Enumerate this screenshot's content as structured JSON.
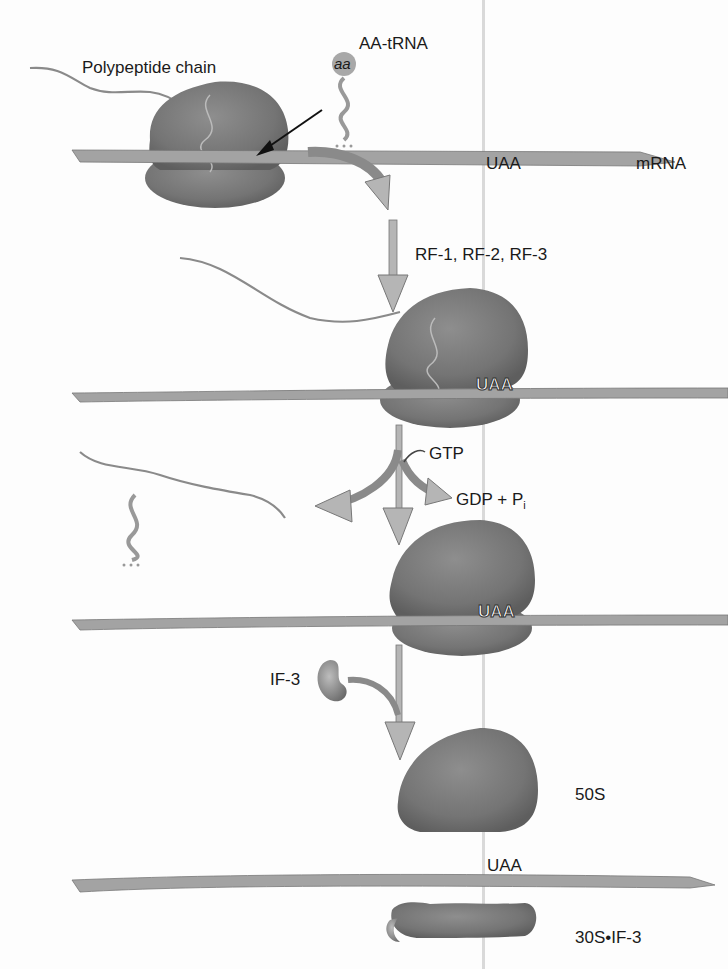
{
  "figure": {
    "labels": {
      "polypeptide": "Polypeptide chain",
      "aa_trna": "AA-tRNA",
      "aa": "aa",
      "mrna": "mRNA",
      "uaa": "UAA",
      "release_factors": "RF-1, RF-2, RF-3",
      "gtp": "GTP",
      "gdp": "GDP + P",
      "gdp_sub": "i",
      "if3": "IF-3",
      "s50": "50S",
      "s30_if3": "30S•IF-3"
    },
    "colors": {
      "ribosome": "#6e6e6e",
      "ribosome_light": "#8c8c8c",
      "mrna": "#9a9a9a",
      "arrow_fill": "#b5b5b5",
      "chain": "#8a8a8a",
      "text": "#1a1a1a"
    },
    "steps": [
      {
        "step": 1,
        "description": "Ribosome with polypeptide chain on mRNA; AA-tRNA approaches; UAA stop codon"
      },
      {
        "step": 2,
        "description": "Release factors RF-1, RF-2, RF-3 bind at UAA"
      },
      {
        "step": 3,
        "description": "GTP hydrolyzed to GDP + Pi; polypeptide and tRNA released"
      },
      {
        "step": 4,
        "description": "IF-3 binds; ribosome dissociates into 50S and 30S•IF-3"
      }
    ]
  }
}
